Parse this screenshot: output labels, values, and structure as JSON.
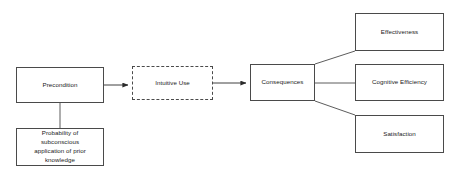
{
  "diagram": {
    "background_color": "#ffffff",
    "line_color": "#4a4a4a",
    "text_color": "#1a1a1a",
    "nodes": [
      {
        "id": "precondition",
        "label": "Precondition",
        "style": "solid",
        "x": 16,
        "y": 67,
        "w": 88,
        "h": 36
      },
      {
        "id": "probability",
        "label": "Probability of\nsubconscious\napplication of prior\nknowledge",
        "style": "solid",
        "x": 16,
        "y": 128,
        "w": 88,
        "h": 38
      },
      {
        "id": "intuitive-use",
        "label": "Intuitive Use",
        "style": "dashed",
        "x": 132,
        "y": 66,
        "w": 81,
        "h": 34
      },
      {
        "id": "consequences",
        "label": "Consequences",
        "style": "solid",
        "x": 250,
        "y": 64,
        "w": 65,
        "h": 37
      },
      {
        "id": "effectiveness",
        "label": "Effectiveness",
        "style": "solid",
        "x": 355,
        "y": 13,
        "w": 89,
        "h": 38
      },
      {
        "id": "cognitive-efficiency",
        "label": "Cognitive Efficiency",
        "style": "solid",
        "x": 355,
        "y": 64,
        "w": 89,
        "h": 37
      },
      {
        "id": "satisfaction",
        "label": "Satisfaction",
        "style": "solid",
        "x": 355,
        "y": 115,
        "w": 89,
        "h": 38
      }
    ],
    "edges": [
      {
        "id": "precondition-to-intuitive-use",
        "from": "precondition",
        "to": "intuitive-use",
        "arrow": true
      },
      {
        "id": "precondition-to-probability",
        "from": "precondition",
        "to": "probability",
        "arrow": false
      },
      {
        "id": "intuitive-use-to-consequences",
        "from": "intuitive-use",
        "to": "consequences",
        "arrow": true
      },
      {
        "id": "consequences-to-effectiveness",
        "from": "consequences",
        "to": "effectiveness",
        "arrow": false
      },
      {
        "id": "consequences-to-cognitive-efficiency",
        "from": "consequences",
        "to": "cognitive-efficiency",
        "arrow": false
      },
      {
        "id": "consequences-to-satisfaction",
        "from": "consequences",
        "to": "satisfaction",
        "arrow": false
      }
    ]
  }
}
